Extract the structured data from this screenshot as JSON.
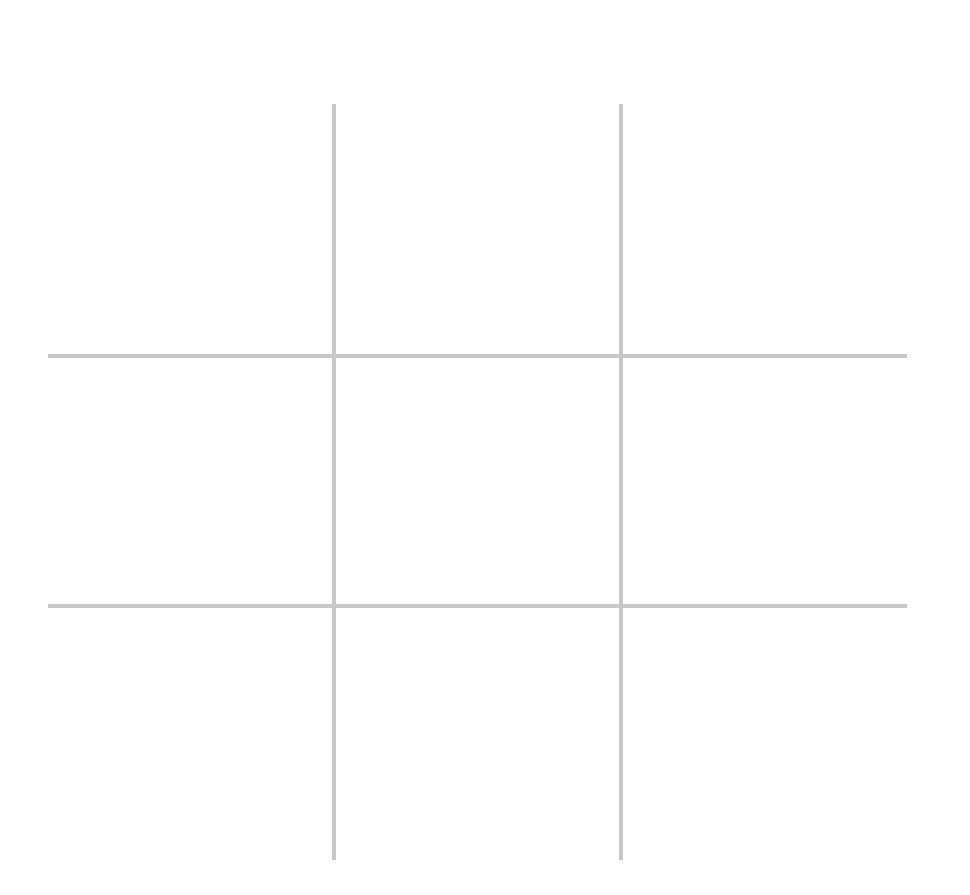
{
  "game": {
    "type": "tic-tac-toe",
    "grid_size": 3,
    "line_color": "#c8c8c8",
    "background_color": "#ffffff",
    "cells": [
      {
        "row": 0,
        "col": 0,
        "mark": ""
      },
      {
        "row": 0,
        "col": 1,
        "mark": ""
      },
      {
        "row": 0,
        "col": 2,
        "mark": ""
      },
      {
        "row": 1,
        "col": 0,
        "mark": ""
      },
      {
        "row": 1,
        "col": 1,
        "mark": ""
      },
      {
        "row": 1,
        "col": 2,
        "mark": ""
      },
      {
        "row": 2,
        "col": 0,
        "mark": ""
      },
      {
        "row": 2,
        "col": 1,
        "mark": ""
      },
      {
        "row": 2,
        "col": 2,
        "mark": ""
      }
    ]
  }
}
